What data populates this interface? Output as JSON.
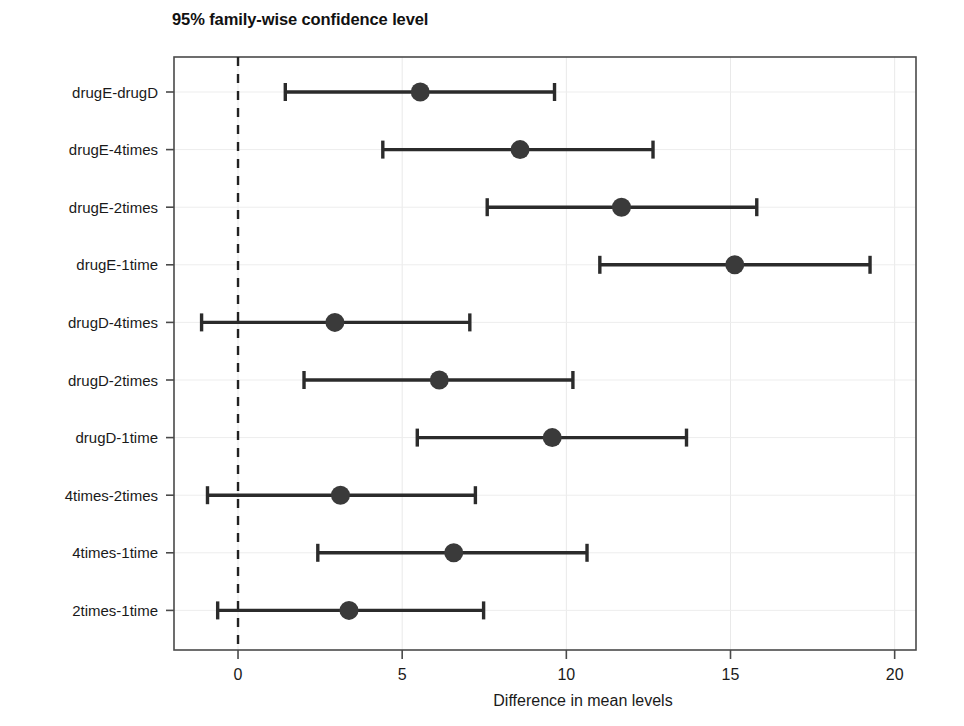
{
  "chart_data": {
    "type": "scatter",
    "title": "95% family-wise confidence level",
    "subtitle": "",
    "xlabel": "Difference in mean levels",
    "ylabel": "",
    "xlim": [
      -1.95,
      20.65
    ],
    "xticks": [
      0,
      5,
      10,
      15,
      20
    ],
    "xticklabels": [
      "0",
      "5",
      "10",
      "15",
      "20"
    ],
    "grid": true,
    "legend": null,
    "reference_line": {
      "x": 0,
      "style": "dashed",
      "color": "#222222"
    },
    "categories": [
      "drugE-drugD",
      "drugE-4times",
      "drugE-2times",
      "drugE-1time",
      "drugD-4times",
      "drugD-2times",
      "drugD-1time",
      "4times-2times",
      "4times-1time",
      "2times-1time"
    ],
    "series": [
      {
        "name": "Mean difference with 95% CI",
        "point_estimate": [
          5.55,
          8.59,
          11.68,
          15.13,
          2.95,
          6.13,
          9.57,
          3.12,
          6.57,
          3.38
        ],
        "ci_lower": [
          1.44,
          4.41,
          7.59,
          11.02,
          -1.11,
          2.01,
          5.46,
          -0.93,
          2.43,
          -0.62
        ],
        "ci_upper": [
          9.64,
          12.64,
          15.8,
          19.25,
          7.06,
          10.2,
          13.66,
          7.23,
          10.63,
          7.48
        ]
      }
    ],
    "marker_color": "#3a3a3a",
    "line_color": "#2b2b2b"
  },
  "figure": {
    "title_text": "95% family-wise confidence level",
    "x_axis_title": "Difference in mean levels"
  }
}
